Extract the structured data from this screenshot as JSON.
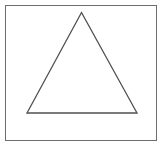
{
  "figure": {
    "caption": "",
    "canvas": {
      "width": 163,
      "height": 148,
      "background_color": "#ffffff"
    },
    "frame": {
      "name": "outer-rectangle",
      "x": 5.5,
      "y": 5.5,
      "width": 151,
      "height": 135,
      "stroke_color": "#6e6e6e",
      "stroke_width": 1.4,
      "fill_color": "none"
    },
    "shapes": [
      {
        "name": "triangle",
        "type": "polygon",
        "sides": 3,
        "points": "81.5,12.5 137,113 27,113",
        "vertices": [
          {
            "label": "apex",
            "x": 81.5,
            "y": 12.5
          },
          {
            "label": "base-right",
            "x": 137,
            "y": 113
          },
          {
            "label": "base-left",
            "x": 27,
            "y": 113
          }
        ],
        "stroke_color": "#4f4f4f",
        "stroke_width": 1.3,
        "fill_color": "none"
      }
    ]
  }
}
